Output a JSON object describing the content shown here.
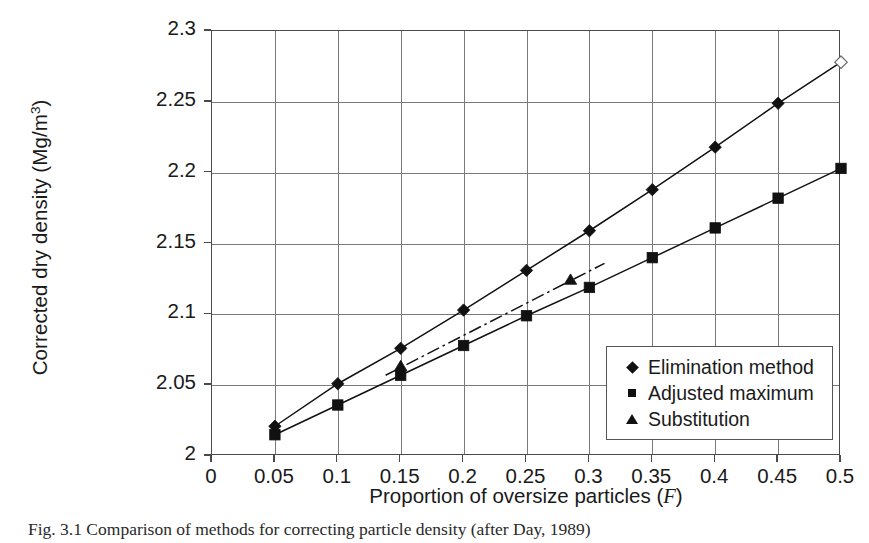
{
  "figure": {
    "caption": "Fig. 3.1  Comparison of methods for correcting particle density (after Day, 1989)"
  },
  "chart_data": {
    "type": "line",
    "title": "",
    "xlabel": "Proportion of oversize particles (F)",
    "xlabel_plain": "Proportion of oversize particles (",
    "xlabel_italic": "F",
    "xlabel_tail": ")",
    "ylabel": "Corrected dry density (Mg/m",
    "ylabel_sup": "3",
    "ylabel_tail": ")",
    "xlim": [
      0,
      0.5
    ],
    "ylim": [
      2.0,
      2.3
    ],
    "xticks": [
      "0",
      "0.05",
      "0.1",
      "0.15",
      "0.2",
      "0.25",
      "0.3",
      "0.35",
      "0.4",
      "0.45",
      "0.5"
    ],
    "xtick_values": [
      0,
      0.05,
      0.1,
      0.15,
      0.2,
      0.25,
      0.3,
      0.35,
      0.4,
      0.45,
      0.5
    ],
    "yticks": [
      "2",
      "2.05",
      "2.1",
      "2.15",
      "2.2",
      "2.25",
      "2.3"
    ],
    "ytick_values": [
      2.0,
      2.05,
      2.1,
      2.15,
      2.2,
      2.25,
      2.3
    ],
    "grid": true,
    "grid_color": "#7a7a7a",
    "axis_color": "#4a4a4a",
    "legend_position": "bottom-right",
    "series": [
      {
        "name": "Elimination method",
        "marker": "diamond",
        "line": "solid",
        "color": "#111111",
        "x": [
          0.05,
          0.1,
          0.15,
          0.2,
          0.25,
          0.3,
          0.35,
          0.4,
          0.45,
          0.5
        ],
        "values": [
          2.021,
          2.051,
          2.076,
          2.103,
          2.131,
          2.159,
          2.188,
          2.218,
          2.249,
          2.278
        ],
        "open_marker_indices": [
          9
        ]
      },
      {
        "name": "Adjusted maximum",
        "marker": "square",
        "line": "solid",
        "color": "#111111",
        "x": [
          0.05,
          0.1,
          0.15,
          0.2,
          0.25,
          0.3,
          0.35,
          0.4,
          0.45,
          0.5
        ],
        "values": [
          2.015,
          2.036,
          2.057,
          2.078,
          2.099,
          2.119,
          2.14,
          2.161,
          2.182,
          2.203
        ],
        "open_marker_indices": []
      },
      {
        "name": "Substitution",
        "marker": "triangle",
        "line": "dash-dot",
        "color": "#111111",
        "x": [
          0.15,
          0.285
        ],
        "values": [
          2.063,
          2.124
        ],
        "line_x": [
          0.138,
          0.312
        ],
        "line_values": [
          2.057,
          2.136
        ],
        "open_marker_indices": []
      }
    ]
  },
  "legend": {
    "items": [
      {
        "marker": "diamond",
        "label": "Elimination method"
      },
      {
        "marker": "square",
        "label": "Adjusted maximum"
      },
      {
        "marker": "triangle",
        "label": "Substitution"
      }
    ]
  }
}
